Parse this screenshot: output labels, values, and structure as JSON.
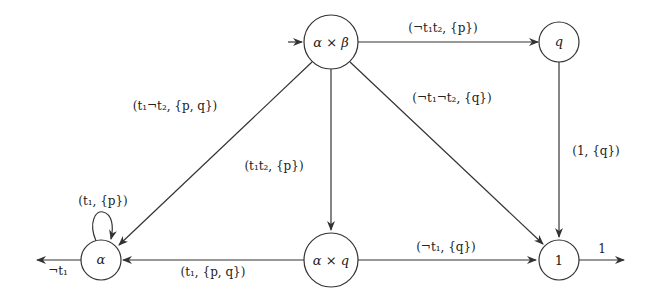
{
  "diagram": {
    "type": "automaton",
    "nodes": [
      {
        "id": "ab",
        "label": "α × β",
        "initial": true
      },
      {
        "id": "q",
        "label": "q"
      },
      {
        "id": "alpha",
        "label": "α"
      },
      {
        "id": "aq",
        "label": "α × q"
      },
      {
        "id": "one",
        "label": "1"
      }
    ],
    "edges": [
      {
        "from": "ab",
        "to": "q",
        "label": "(¬t₁t₂, {p})"
      },
      {
        "from": "ab",
        "to": "one",
        "label": "(¬t₁¬t₂, {q})"
      },
      {
        "from": "ab",
        "to": "alpha",
        "label": "(t₁¬t₂, {p, q})"
      },
      {
        "from": "ab",
        "to": "aq",
        "label": "(t₁t₂, {p})"
      },
      {
        "from": "q",
        "to": "one",
        "label": "(1, {q})"
      },
      {
        "from": "alpha",
        "to": "alpha",
        "label": "(t₁, {p})"
      },
      {
        "from": "aq",
        "to": "alpha",
        "label": "(t₁, {p, q})"
      },
      {
        "from": "aq",
        "to": "one",
        "label": "(¬t₁, {q})"
      },
      {
        "from": "alpha",
        "to": "out",
        "label": "¬t₁"
      },
      {
        "from": "one",
        "to": "out",
        "label": "1"
      }
    ]
  }
}
